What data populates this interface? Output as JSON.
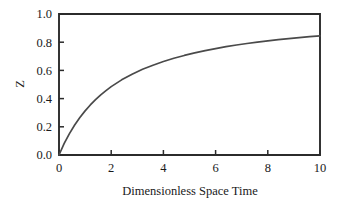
{
  "chart_data": {
    "type": "line",
    "title": "",
    "subtitle": "",
    "xlabel": "Dimensionless Space Time",
    "ylabel": "Z",
    "xlim": [
      0,
      10
    ],
    "ylim": [
      0.0,
      1.0
    ],
    "grid": false,
    "legend": null,
    "legend_position": "none",
    "line_color": "#4a4a4a",
    "axis_color": "#2b2b2b",
    "background_color": "#ffffff",
    "xticks": [
      0,
      2,
      4,
      6,
      8,
      10
    ],
    "xtick_labels": [
      "0",
      "2",
      "4",
      "6",
      "8",
      "10"
    ],
    "yticks": [
      0.0,
      0.2,
      0.4,
      0.6,
      0.8,
      1.0
    ],
    "ytick_labels": [
      "0.0",
      "0.2",
      "0.4",
      "0.6",
      "0.8",
      "1.0"
    ],
    "tick_direction": "in",
    "series": [
      {
        "name": "Z",
        "x": [
          0.0,
          0.2,
          0.4,
          0.6,
          0.8,
          1.0,
          1.2,
          1.4,
          1.6,
          1.8,
          2.0,
          2.4,
          2.8,
          3.2,
          3.6,
          4.0,
          4.4,
          4.8,
          5.2,
          5.6,
          6.0,
          6.4,
          6.8,
          7.2,
          7.6,
          8.0,
          8.4,
          8.8,
          9.2,
          9.6,
          10.0
        ],
        "values": [
          0.0,
          0.082,
          0.152,
          0.213,
          0.266,
          0.313,
          0.355,
          0.393,
          0.427,
          0.457,
          0.485,
          0.533,
          0.573,
          0.608,
          0.637,
          0.663,
          0.686,
          0.706,
          0.724,
          0.74,
          0.755,
          0.768,
          0.78,
          0.791,
          0.801,
          0.81,
          0.818,
          0.825,
          0.832,
          0.839,
          0.845
        ]
      }
    ]
  },
  "axes": {
    "ylabel_text": "Z",
    "xlabel_text": "Dimensionless Space Time"
  }
}
